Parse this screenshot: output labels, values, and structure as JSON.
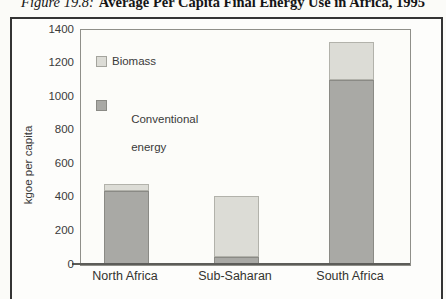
{
  "figure": {
    "caption_prefix": "Figure 19.8:",
    "caption_text": "Average Per Capita Final Energy Use in Africa, 1995"
  },
  "chart_data": {
    "type": "bar",
    "stacked": true,
    "title": "Average Per Capita Final Energy Use in Africa, 1995",
    "categories": [
      "North Africa",
      "Sub-Saharan",
      "South Africa"
    ],
    "series": [
      {
        "name": "Conventional energy",
        "values": [
          440,
          50,
          1100
        ],
        "color": "#a9a9a5",
        "border_color": "#8a8a85"
      },
      {
        "name": "Biomass",
        "values": [
          45,
          360,
          230
        ],
        "color": "#dcdcd6",
        "border_color": "#b2b2ab"
      }
    ],
    "ylabel": "kgoe per capita",
    "xlabel": "",
    "ylim": [
      0,
      1400
    ],
    "yticks": [
      0,
      200,
      400,
      600,
      800,
      1000,
      1200,
      1400
    ],
    "grid": false,
    "legend_position": "upper-left-inside"
  },
  "legend": {
    "items": [
      {
        "label": "Biomass",
        "color": "#dcdcd6",
        "border_color": "#a4a49d"
      },
      {
        "label": "Conventional",
        "label_line2": "energy",
        "color": "#a9a9a5",
        "border_color": "#8a8a85"
      }
    ]
  }
}
